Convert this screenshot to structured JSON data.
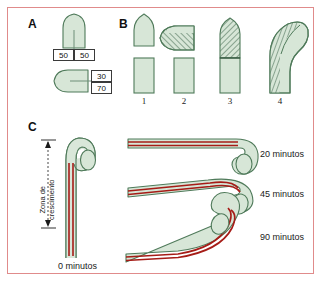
{
  "figure": {
    "border_color": "#e08b8b",
    "background": "#ffffff",
    "cell_fill": "#d7e6d7",
    "cell_stroke": "#4f7a5a",
    "hatch_color": "#5d7f68",
    "tube_red": "#a61c17",
    "text_color": "#1a1a1a"
  },
  "panels": {
    "a": {
      "letter": "A",
      "diagram_top": {
        "box_left_value": "50",
        "box_right_value": "50"
      },
      "diagram_bottom": {
        "box_top_value": "30",
        "box_bottom_value": "70"
      }
    },
    "b": {
      "letter": "B",
      "items": [
        {
          "number": "1"
        },
        {
          "number": "2"
        },
        {
          "number": "3"
        },
        {
          "number": "4"
        }
      ]
    },
    "c": {
      "letter": "C",
      "zone_label_line1": "Zona de",
      "zone_label_line2": "crescimento",
      "time_zero_label": "0 minutos",
      "stages": [
        {
          "time_label": "20 minutos"
        },
        {
          "time_label": "45 minutos"
        },
        {
          "time_label": "90 minutos"
        }
      ]
    }
  }
}
